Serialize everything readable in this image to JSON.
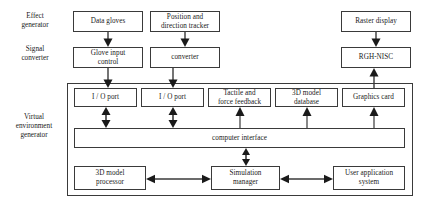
{
  "diagram": {
    "width": 422,
    "height": 206,
    "line_color": "#3a3a3a",
    "text_color": "#1a1a1a",
    "background": "#ffffff"
  },
  "side_labels": [
    {
      "key": "effect_generator",
      "text": "Effect\ngenerator",
      "line1": "Effect",
      "line2": "generator"
    },
    {
      "key": "signal_converter",
      "text": "Signal\nconverter",
      "line1": "Signal",
      "line2": "converter"
    },
    {
      "key": "virtual_environment_generator",
      "line1": "Virtual",
      "line2": "environment",
      "line3": "generator"
    }
  ],
  "nodes": {
    "data_gloves": "Data gloves",
    "position_direction_tracker_line1": "Position and",
    "position_direction_tracker_line2": "direction tracker",
    "raster_display": "Raster display",
    "glove_input_control_line1": "Glove input",
    "glove_input_control_line2": "control",
    "converter": "converter",
    "rgh_nisc": "RGH-NISC",
    "io_port_1": "I / O port",
    "io_port_2": "I / O port",
    "tactile_force_feedback_line1": "Tactile and",
    "tactile_force_feedback_line2": "force feedback",
    "model_database_line1": "3D model",
    "model_database_line2": "database",
    "graphics_card": "Graphics card",
    "computer_interface": "computer interface",
    "model_processor_line1": "3D model",
    "model_processor_line2": "processor",
    "simulation_manager_line1": "Simulation",
    "simulation_manager_line2": "manager",
    "user_application_system_line1": "User application",
    "user_application_system_line2": "system"
  },
  "connections": [
    {
      "name": "data-gloves-to-glove-input-control",
      "direction": "down"
    },
    {
      "name": "position-tracker-to-converter",
      "direction": "down"
    },
    {
      "name": "raster-display-to-rgh-nisc",
      "direction": "down"
    },
    {
      "name": "glove-input-control-to-io-port-1",
      "direction": "down"
    },
    {
      "name": "converter-to-io-port-2",
      "direction": "down"
    },
    {
      "name": "graphics-card-to-rgh-nisc",
      "direction": "up"
    },
    {
      "name": "io-port-1-to-computer-interface",
      "direction": "both"
    },
    {
      "name": "io-port-2-to-computer-interface",
      "direction": "both"
    },
    {
      "name": "computer-interface-to-tactile-force-feedback",
      "direction": "up"
    },
    {
      "name": "computer-interface-to-3d-model-database",
      "direction": "up"
    },
    {
      "name": "computer-interface-to-graphics-card",
      "direction": "up"
    },
    {
      "name": "computer-interface-to-simulation-manager",
      "direction": "both"
    },
    {
      "name": "3d-model-processor-to-simulation-manager",
      "direction": "both"
    },
    {
      "name": "simulation-manager-to-user-application-system",
      "direction": "both"
    }
  ]
}
